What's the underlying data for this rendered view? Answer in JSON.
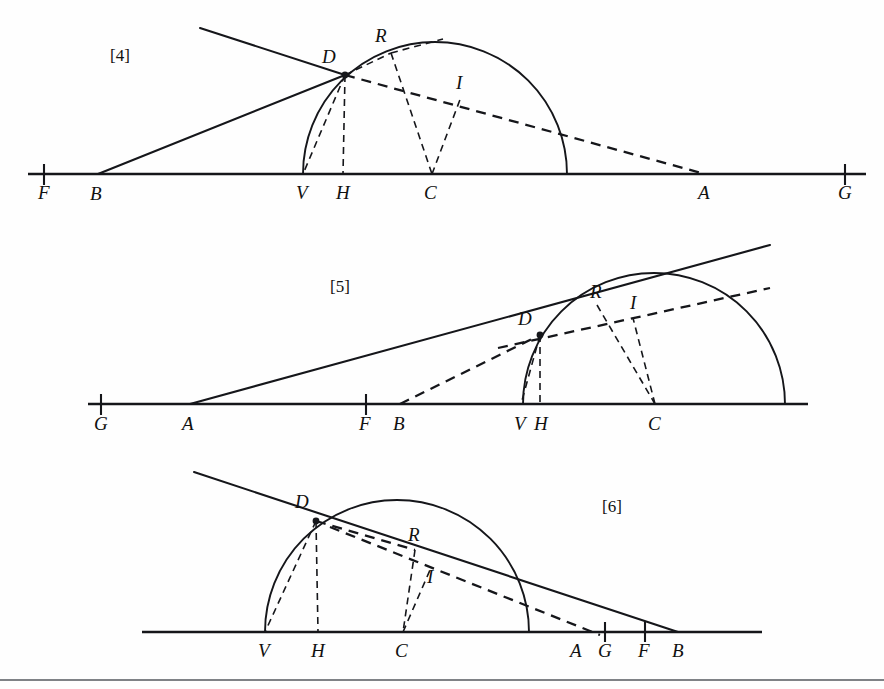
{
  "page": {
    "width": 884,
    "height": 689,
    "background": "#fefefe",
    "ink_color": "#15161a",
    "kind": "geometric-construction-plate",
    "figure_count": 3
  },
  "figures": [
    {
      "id": "figure-4",
      "caption": "[4]",
      "caption_x": 120,
      "caption_y": 61,
      "baseline_y": 174,
      "baseline_x1": 28,
      "baseline_x2": 866,
      "circle": {
        "cx": 435,
        "cy": 174,
        "r": 132
      },
      "points": [
        {
          "name": "F",
          "x": 44,
          "y": 174,
          "label_x": 38,
          "label_y": 199,
          "tick": true
        },
        {
          "name": "B",
          "x": 98,
          "y": 174,
          "label_x": 90,
          "label_y": 200,
          "tick": false
        },
        {
          "name": "V",
          "x": 303,
          "y": 174,
          "label_x": 296,
          "label_y": 199,
          "tick": false
        },
        {
          "name": "H",
          "x": 343,
          "y": 174,
          "label_x": 336,
          "label_y": 199,
          "tick": false
        },
        {
          "name": "C",
          "x": 432,
          "y": 174,
          "label_x": 424,
          "label_y": 199,
          "tick": false
        },
        {
          "name": "A",
          "x": 705,
          "y": 174,
          "label_x": 698,
          "label_y": 199,
          "tick": false
        },
        {
          "name": "G",
          "x": 845,
          "y": 174,
          "label_x": 838,
          "label_y": 199,
          "tick": true
        },
        {
          "name": "D",
          "x": 345,
          "y": 75,
          "label_x": 322,
          "label_y": 63,
          "tick": false
        },
        {
          "name": "R",
          "x": 391,
          "y": 53,
          "label_x": 375,
          "label_y": 42,
          "tick": false
        },
        {
          "name": "I",
          "x": 461,
          "y": 97,
          "label_x": 456,
          "label_y": 89,
          "tick": false
        }
      ]
    },
    {
      "id": "figure-5",
      "caption": "[5]",
      "caption_x": 340,
      "caption_y": 292,
      "baseline_y": 404,
      "baseline_x1": 88,
      "baseline_x2": 808,
      "circle": {
        "cx": 654,
        "cy": 404,
        "r": 131
      },
      "points": [
        {
          "name": "G",
          "x": 101,
          "y": 404,
          "label_x": 94,
          "label_y": 430,
          "tick": true
        },
        {
          "name": "A",
          "x": 190,
          "y": 404,
          "label_x": 182,
          "label_y": 430,
          "tick": false
        },
        {
          "name": "F",
          "x": 366,
          "y": 404,
          "label_x": 359,
          "label_y": 430,
          "tick": true
        },
        {
          "name": "B",
          "x": 400,
          "y": 404,
          "label_x": 393,
          "label_y": 430,
          "tick": false
        },
        {
          "name": "V",
          "x": 521,
          "y": 404,
          "label_x": 514,
          "label_y": 430,
          "tick": false
        },
        {
          "name": "H",
          "x": 540,
          "y": 404,
          "label_x": 534,
          "label_y": 430,
          "tick": false
        },
        {
          "name": "C",
          "x": 655,
          "y": 404,
          "label_x": 648,
          "label_y": 430,
          "tick": false
        },
        {
          "name": "D",
          "x": 540,
          "y": 335,
          "label_x": 518,
          "label_y": 325,
          "tick": false
        },
        {
          "name": "R",
          "x": 597,
          "y": 305,
          "label_x": 590,
          "label_y": 298,
          "tick": false
        },
        {
          "name": "I",
          "x": 633,
          "y": 318,
          "label_x": 630,
          "label_y": 309,
          "tick": false
        }
      ]
    },
    {
      "id": "figure-6",
      "caption": "[6]",
      "caption_x": 612,
      "caption_y": 512,
      "baseline_y": 632,
      "baseline_x1": 142,
      "baseline_x2": 762,
      "circle": {
        "cx": 396,
        "cy": 632,
        "r": 132
      },
      "points": [
        {
          "name": "V",
          "x": 265,
          "y": 632,
          "label_x": 258,
          "label_y": 657,
          "tick": false
        },
        {
          "name": "H",
          "x": 318,
          "y": 632,
          "label_x": 311,
          "label_y": 657,
          "tick": false
        },
        {
          "name": "C",
          "x": 403,
          "y": 632,
          "label_x": 395,
          "label_y": 657,
          "tick": false
        },
        {
          "name": "A",
          "x": 578,
          "y": 632,
          "label_x": 570,
          "label_y": 657,
          "tick": false
        },
        {
          "name": "G",
          "x": 605,
          "y": 632,
          "label_x": 598,
          "label_y": 657,
          "tick": true
        },
        {
          "name": "F",
          "x": 645,
          "y": 632,
          "label_x": 638,
          "label_y": 657,
          "tick": true
        },
        {
          "name": "B",
          "x": 678,
          "y": 632,
          "label_x": 672,
          "label_y": 657,
          "tick": false
        },
        {
          "name": "D",
          "x": 316,
          "y": 521,
          "label_x": 295,
          "label_y": 508,
          "tick": false
        },
        {
          "name": "R",
          "x": 415,
          "y": 550,
          "label_x": 408,
          "label_y": 541,
          "tick": false
        },
        {
          "name": "I",
          "x": 430,
          "y": 578,
          "label_x": 427,
          "label_y": 583,
          "tick": false
        }
      ]
    }
  ],
  "footer": {
    "rule_y": 680
  }
}
